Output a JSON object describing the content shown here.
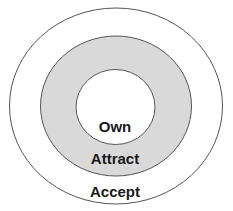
{
  "diagram": {
    "type": "concentric-circles",
    "rings": [
      {
        "name": "outer",
        "label": "Accept",
        "fill": "#ffffff",
        "stroke": "#555555"
      },
      {
        "name": "middle",
        "label": "Attract",
        "fill": "#d9d9d9",
        "stroke": "#555555"
      },
      {
        "name": "inner",
        "label": "Own",
        "fill": "#ffffff",
        "stroke": "#555555"
      }
    ]
  }
}
